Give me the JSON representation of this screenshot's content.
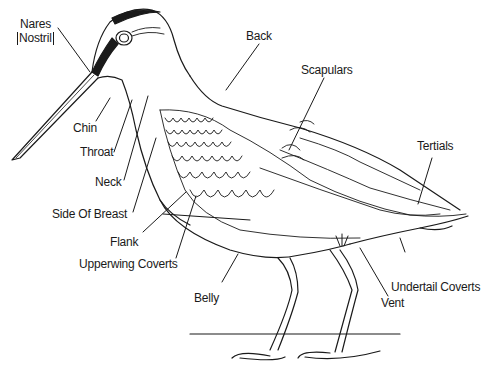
{
  "diagram": {
    "labels": {
      "nares": "Nares",
      "nostril": "Nostril",
      "chin": "Chin",
      "throat": "Throat",
      "neck": "Neck",
      "side_of_breast": "Side Of Breast",
      "flank": "Flank",
      "upperwing_coverts": "Upperwing Coverts",
      "belly": "Belly",
      "back": "Back",
      "scapulars": "Scapulars",
      "tertials": "Tertials",
      "undertail_coverts": "Undertail Coverts",
      "vent": "Vent"
    },
    "colors": {
      "line": "#1a1a1a",
      "background": "#ffffff"
    }
  }
}
